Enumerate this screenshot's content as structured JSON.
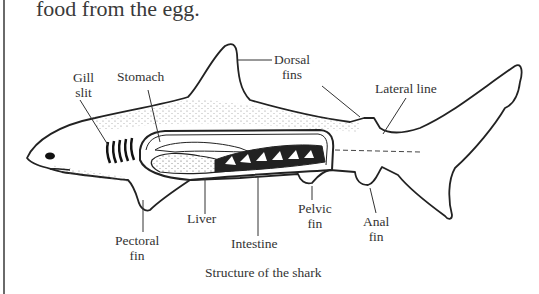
{
  "intro_text": "food from the egg.",
  "diagram": {
    "caption": "Structure of the shark",
    "labels": {
      "gill_slit_1": "Gill",
      "gill_slit_2": "slit",
      "stomach": "Stomach",
      "dorsal_fins_1": "Dorsal",
      "dorsal_fins_2": "fins",
      "lateral_line": "Lateral line",
      "liver": "Liver",
      "pectoral_fin_1": "Pectoral",
      "pectoral_fin_2": "fin",
      "intestine": "Intestine",
      "pelvic_fin_1": "Pelvic",
      "pelvic_fin_2": "fin",
      "anal_fin_1": "Anal",
      "anal_fin_2": "fin"
    },
    "colors": {
      "ink": "#222222",
      "stipple": "#555555",
      "border": "#6a6a6a"
    }
  }
}
